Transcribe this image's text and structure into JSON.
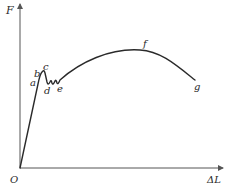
{
  "diagram": {
    "axes": {
      "y_label": "F",
      "x_label": "ΔL",
      "origin_label": "O"
    },
    "points": [
      {
        "id": "a",
        "label": "a"
      },
      {
        "id": "b",
        "label": "b"
      },
      {
        "id": "c",
        "label": "c"
      },
      {
        "id": "d",
        "label": "d"
      },
      {
        "id": "e",
        "label": "e"
      },
      {
        "id": "f",
        "label": "f"
      },
      {
        "id": "g",
        "label": "g"
      }
    ],
    "colors": {
      "line": "#2a2a2a",
      "axis": "#555555",
      "background": "#ffffff"
    }
  }
}
